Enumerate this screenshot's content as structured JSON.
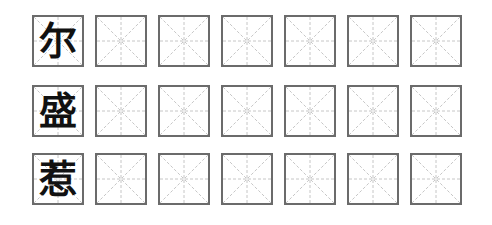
{
  "worksheet": {
    "grid_type": "mi-zi-ge",
    "columns": 7,
    "rows": [
      {
        "character": "尔"
      },
      {
        "character": "盛"
      },
      {
        "character": "惹"
      }
    ]
  },
  "colors": {
    "border": "#6b6b6b",
    "guide": "#b0b0b0",
    "ink": "#111111"
  }
}
